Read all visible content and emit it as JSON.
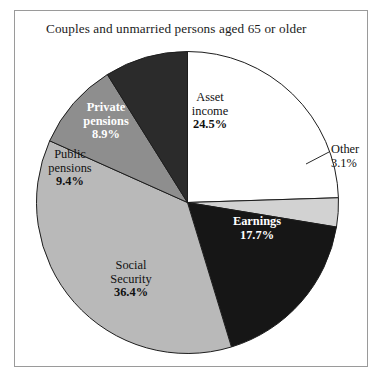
{
  "figure": {
    "title": "Couples and unmarried persons aged 65 or older",
    "background": "#ffffff",
    "frame_color": "#9a9a9a"
  },
  "chart_data": {
    "type": "pie",
    "title": "Couples and unmarried persons aged 65 or older",
    "xlabel": "",
    "ylabel": "",
    "legend": "none",
    "grid": false,
    "start_angle_deg": 0,
    "direction": "clockwise",
    "total": 100.0,
    "categories": [
      "Asset income",
      "Other",
      "Earnings",
      "Social Security",
      "Public pensions",
      "Private pensions"
    ],
    "values": [
      24.5,
      3.1,
      17.7,
      36.4,
      9.4,
      8.9
    ],
    "slices": [
      {
        "name": "Asset income",
        "label_line1": "Asset",
        "label_line2": "income",
        "value": 24.5,
        "value_label": "24.5%",
        "color": "#ffffff",
        "text_color": "#111111",
        "label_placement": "inside"
      },
      {
        "name": "Other",
        "label_line1": "Other",
        "label_line2": "",
        "value": 3.1,
        "value_label": "3.1%",
        "color": "#d2d2d2",
        "text_color": "#111111",
        "label_placement": "outside-leader"
      },
      {
        "name": "Earnings",
        "label_line1": "Earnings",
        "label_line2": "",
        "value": 17.7,
        "value_label": "17.7%",
        "color": "#161616",
        "text_color": "#ffffff",
        "label_placement": "inside"
      },
      {
        "name": "Social Security",
        "label_line1": "Social",
        "label_line2": "Security",
        "value": 36.4,
        "value_label": "36.4%",
        "color": "#b9b9b9",
        "text_color": "#111111",
        "label_placement": "inside"
      },
      {
        "name": "Public pensions",
        "label_line1": "Public",
        "label_line2": "pensions",
        "value": 9.4,
        "value_label": "9.4%",
        "color": "#8e8e8e",
        "text_color": "#111111",
        "label_placement": "inside"
      },
      {
        "name": "Private pensions",
        "label_line1": "Private",
        "label_line2": "pensions",
        "value": 8.9,
        "value_label": "8.9%",
        "color": "#2b2b2b",
        "text_color": "#ffffff",
        "label_placement": "inside"
      }
    ]
  }
}
